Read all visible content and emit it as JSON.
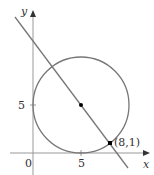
{
  "figure": {
    "axes": {
      "x_label": "x",
      "y_label": "y",
      "origin_label": "0",
      "x_tick_label": "5",
      "y_tick_label": "5"
    },
    "circle": {
      "center": [
        5,
        5
      ],
      "radius": 5
    },
    "line": {
      "through": [
        [
          5,
          5
        ],
        [
          8,
          1
        ]
      ]
    },
    "points": [
      {
        "coords": [
          5,
          5
        ],
        "label": ""
      },
      {
        "coords": [
          8,
          1
        ],
        "label": "(8,1)"
      }
    ],
    "colors": {
      "axis": "#999999",
      "curve": "#777777",
      "point": "#000000",
      "text": "#333333"
    }
  }
}
